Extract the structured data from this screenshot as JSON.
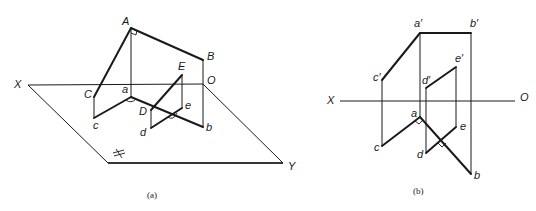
{
  "figure_a": {
    "caption": "(a)",
    "labels": {
      "A": "A",
      "B": "B",
      "C": "C",
      "D": "D",
      "E": "E",
      "a": "a",
      "b": "b",
      "c": "c",
      "d": "d",
      "e": "e",
      "X": "X",
      "O": "O",
      "Y": "Y",
      "H": "H"
    }
  },
  "figure_b": {
    "caption": "(b)",
    "labels": {
      "a_prime": "a′",
      "b_prime": "b′",
      "c_prime": "c′",
      "d_prime": "d′",
      "e_prime": "e′",
      "a": "a",
      "b": "b",
      "c": "c",
      "d": "d",
      "e": "e",
      "X": "X",
      "O": "O"
    }
  }
}
